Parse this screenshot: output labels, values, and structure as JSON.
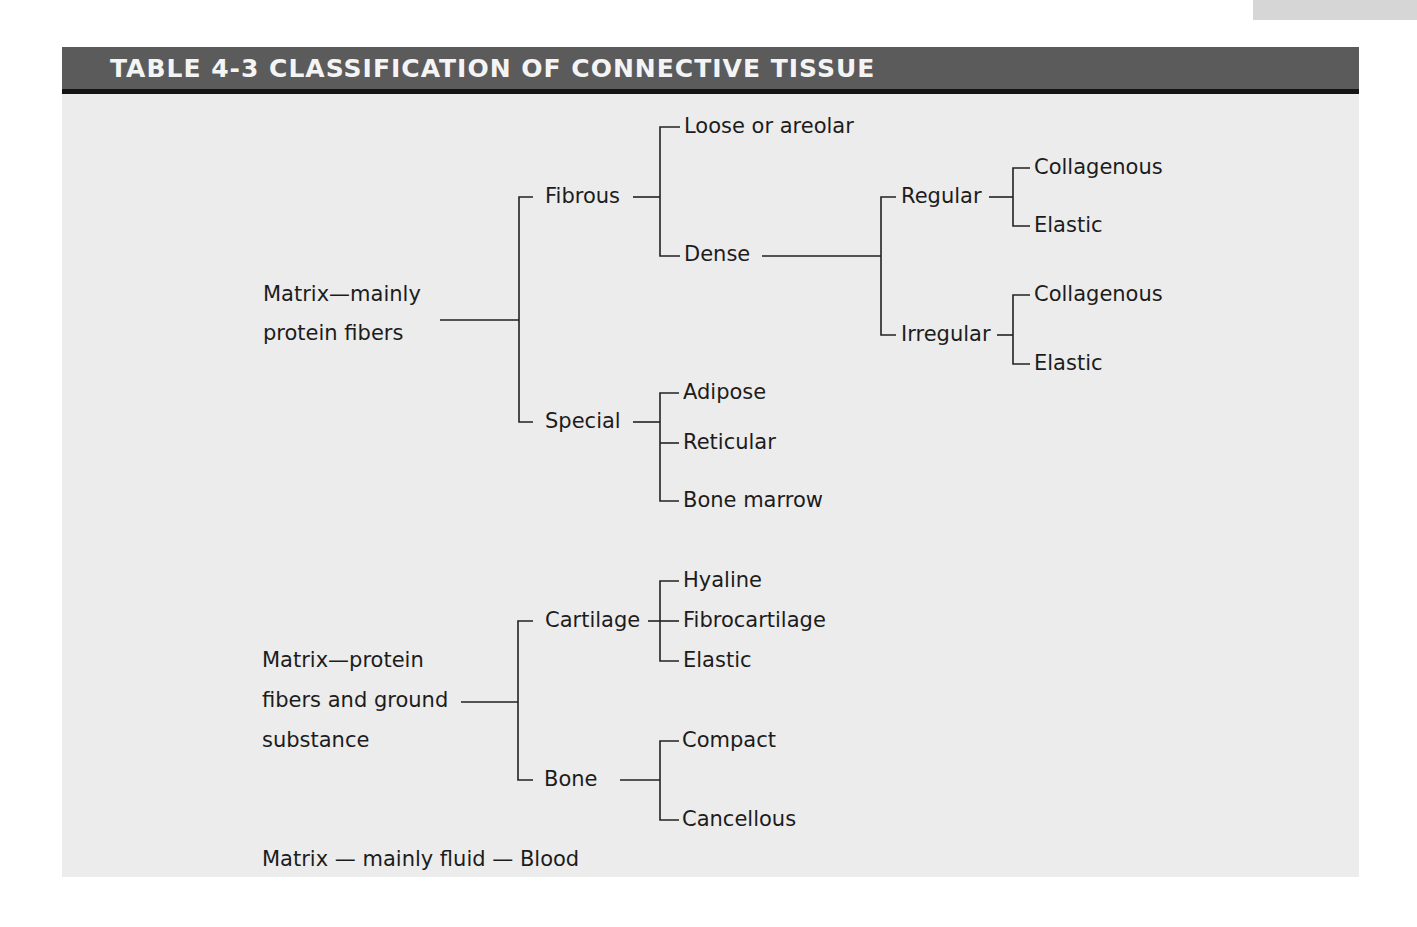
{
  "title": "TABLE 4-3 CLASSIFICATION OF CONNECTIVE TISSUE",
  "colors": {
    "title_bar": "#5b5b5b",
    "title_bar_border": "#141414",
    "title_text": "#f4f4f4",
    "panel_background": "#ececec",
    "text": "#1c1c1c"
  },
  "group1": {
    "root_line1": "Matrix—mainly",
    "root_line2": "protein fibers",
    "fibrous": {
      "label": "Fibrous",
      "loose": "Loose or areolar",
      "dense": {
        "label": "Dense",
        "regular": {
          "label": "Regular",
          "children": [
            "Collagenous",
            "Elastic"
          ]
        },
        "irregular": {
          "label": "Irregular",
          "children": [
            "Collagenous",
            "Elastic"
          ]
        }
      }
    },
    "special": {
      "label": "Special",
      "children": [
        "Adipose",
        "Reticular",
        "Bone marrow"
      ]
    }
  },
  "group2": {
    "root_line1": "Matrix—protein",
    "root_line2": "fibers and ground",
    "root_line3": "substance",
    "cartilage": {
      "label": "Cartilage",
      "children": [
        "Hyaline",
        "Fibrocartilage",
        "Elastic"
      ]
    },
    "bone": {
      "label": "Bone",
      "children": [
        "Compact",
        "Cancellous"
      ]
    }
  },
  "group3": {
    "text": "Matrix — mainly fluid — Blood"
  }
}
